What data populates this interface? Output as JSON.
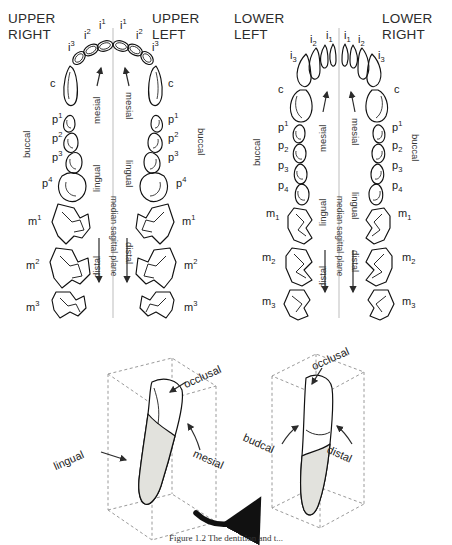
{
  "figure": {
    "caption": "Figure 1.2 The dentition and t...",
    "quadrants": {
      "upper_right": "UPPER\nRIGHT",
      "upper_right_l1": "UPPER",
      "upper_right_l2": "RIGHT",
      "upper_left_l1": "UPPER",
      "upper_left_l2": "LEFT",
      "lower_left_l1": "LOWER",
      "lower_left_l2": "LEFT",
      "lower_right_l1": "LOWER",
      "lower_right_l2": "RIGHT"
    },
    "upper_teeth": {
      "incisors": [
        "i1",
        "i2",
        "i3"
      ],
      "incisor_glyphs": [
        "i",
        "i",
        "i"
      ],
      "incisor_sup": [
        "1",
        "2",
        "3"
      ],
      "canine": "c",
      "premolars_base": [
        "p",
        "p",
        "p",
        "p"
      ],
      "premolars_sup": [
        "1",
        "2",
        "3",
        "4"
      ],
      "molars_base": [
        "m",
        "m",
        "m"
      ],
      "molars_sup": [
        "1",
        "2",
        "3"
      ]
    },
    "lower_teeth": {
      "incisor_glyphs": [
        "i",
        "i",
        "i"
      ],
      "incisor_sub": [
        "1",
        "2",
        "3"
      ],
      "canine": "c",
      "premolar_first_base": "p",
      "premolar_first_sup": "1",
      "premolars_base": [
        "p",
        "p",
        "p"
      ],
      "premolars_sub": [
        "2",
        "3",
        "4"
      ],
      "molars_base": [
        "m",
        "m",
        "m"
      ],
      "molars_sub": [
        "1",
        "2",
        "3"
      ]
    },
    "directions": {
      "buccal": "buccal",
      "lingual": "lingual",
      "mesial": "mesial",
      "distal": "distal",
      "median_sagittal_plane": "median sagittal plane",
      "occlusal": "occlusal"
    },
    "tooth_box_left": {
      "occlusal": "occlusal",
      "lingual": "lingual",
      "mesial": "mesial"
    },
    "tooth_box_right": {
      "occlusal": "occlusal",
      "buccal": "budcal",
      "distal": "distal"
    },
    "colors": {
      "ink": "#1a1a1a",
      "outline": "#111111",
      "root_fill": "#e2e2dd",
      "dashed": "#9a9a9a",
      "midline": "#b9b9b9"
    }
  }
}
